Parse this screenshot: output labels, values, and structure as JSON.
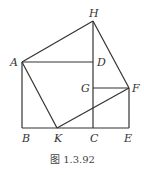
{
  "diagram": {
    "caption": "图 1.3.92",
    "points": {
      "H": {
        "label": "H",
        "x": 93,
        "y": 21
      },
      "A": {
        "label": "A",
        "x": 22,
        "y": 62
      },
      "D": {
        "label": "D",
        "x": 93,
        "y": 62
      },
      "G": {
        "label": "G",
        "x": 93,
        "y": 88
      },
      "F": {
        "label": "F",
        "x": 129,
        "y": 88
      },
      "B": {
        "label": "B",
        "x": 22,
        "y": 128
      },
      "K": {
        "label": "K",
        "x": 57,
        "y": 128
      },
      "C": {
        "label": "C",
        "x": 93,
        "y": 128
      },
      "E": {
        "label": "E",
        "x": 129,
        "y": 128
      }
    },
    "segments": [
      "AH",
      "HF",
      "AD",
      "AB",
      "BE",
      "HC",
      "AK",
      "KF",
      "GF",
      "FE"
    ],
    "line_color": "#333333"
  }
}
